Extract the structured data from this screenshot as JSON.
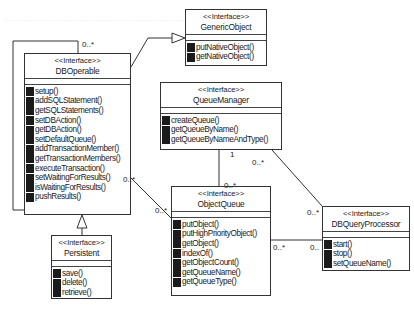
{
  "diagram": {
    "type": "UML class diagram",
    "classes": {
      "generic_object": {
        "stereotype": "<<Interface>>",
        "name": "GenericObject",
        "operations": [
          "putNativeObject()",
          "getNativeObject()"
        ]
      },
      "db_operable": {
        "stereotype": "<<Interface>>",
        "name": "DBOperable",
        "operations": [
          "setup()",
          "addSQLStatement()",
          "getSQLStatements()",
          "setDBAction()",
          "getDBAction()",
          "setDefaultQueue()",
          "addTransactionMember()",
          "getTransactionMembers()",
          "executeTransaction()",
          "setWaitingForResults()",
          "isWaitingForResults()",
          "pushResults()"
        ]
      },
      "persistent": {
        "stereotype": "<<Interface>>",
        "name": "Persistent",
        "operations": [
          "save()",
          "delete()",
          "retrieve()"
        ]
      },
      "queue_manager": {
        "stereotype": "<<Interface>>",
        "name": "QueueManager",
        "operations": [
          "createQueue()",
          "getQueueByName()",
          "getQueueByNameAndType()"
        ]
      },
      "object_queue": {
        "stereotype": "<<Interface>>",
        "name": "ObjectQueue",
        "operations": [
          "putObject()",
          "putHighPriorityObject()",
          "getObject()",
          "indexOf()",
          "getObjectCount()",
          "getQueueName()",
          "getQueueType()"
        ]
      },
      "db_query_processor": {
        "stereotype": "<<Interface>>",
        "name": "DBQueryProcessor",
        "operations": [
          "start()",
          "stop()",
          "setQueueName()"
        ]
      }
    },
    "multiplicities": {
      "dbop_self": "0..*",
      "dbop_to_oq_near_dbop": "0..*",
      "dbop_to_oq_near_oq": "0..*",
      "qm_to_oq_near_qm": "1",
      "qm_to_oq_near_oq": "0..*",
      "qm_to_dbqp_near_qm": "0..*",
      "qm_to_dbqp_near_dbqp": "0..*",
      "oq_to_dbqp_near_oq": "0..*",
      "oq_to_dbqp_near_dbqp": "0.."
    },
    "relationships": [
      {
        "from": "DBOperable",
        "to": "GenericObject",
        "kind": "generalization"
      },
      {
        "from": "Persistent",
        "to": "DBOperable",
        "kind": "generalization"
      },
      {
        "from": "DBOperable",
        "to": "DBOperable",
        "kind": "association"
      },
      {
        "from": "DBOperable",
        "to": "ObjectQueue",
        "kind": "association"
      },
      {
        "from": "QueueManager",
        "to": "ObjectQueue",
        "kind": "association"
      },
      {
        "from": "QueueManager",
        "to": "DBQueryProcessor",
        "kind": "association"
      },
      {
        "from": "ObjectQueue",
        "to": "DBQueryProcessor",
        "kind": "association"
      }
    ]
  }
}
